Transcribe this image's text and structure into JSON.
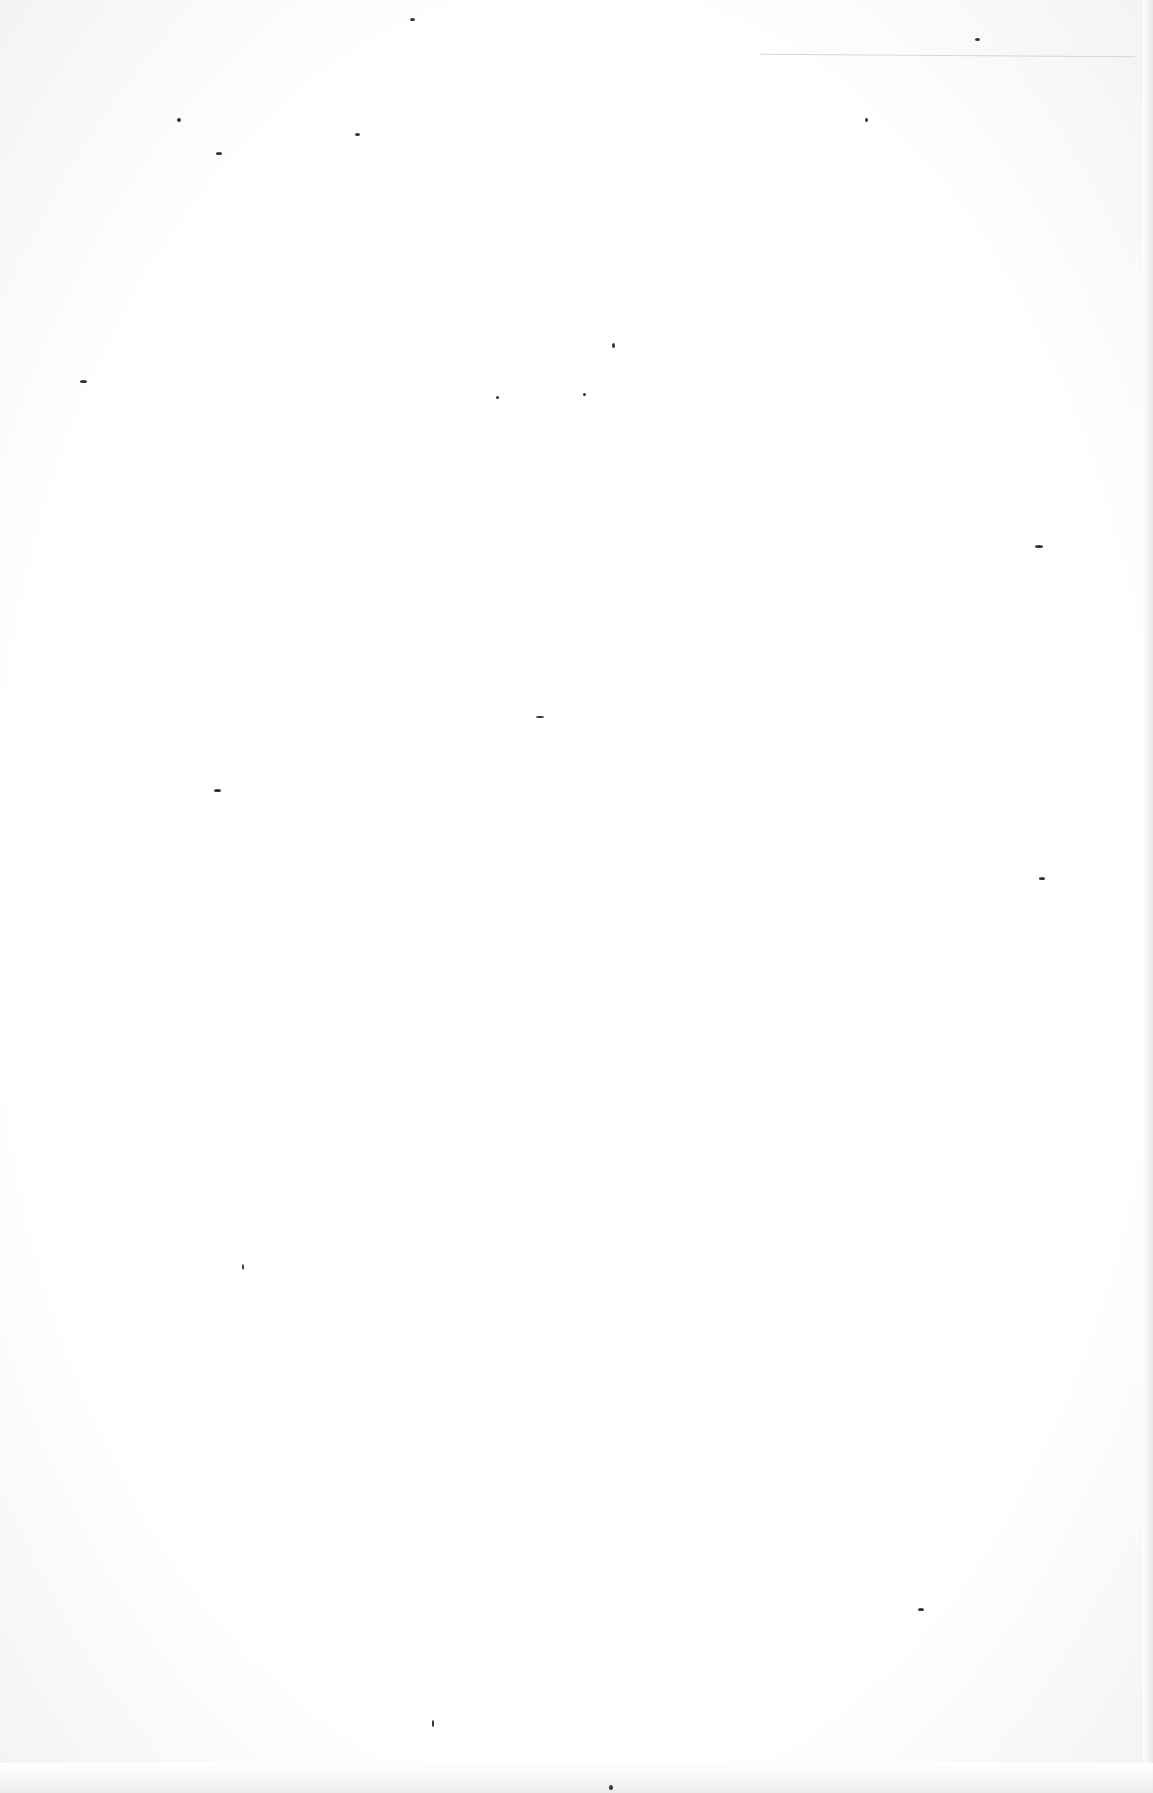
{
  "page": {
    "type": "blank scanned page",
    "text": "",
    "background_color": "#ffffff",
    "speck_color": "#333333"
  },
  "specks": [
    {
      "x": 410,
      "y": 18,
      "w": 5,
      "h": 3
    },
    {
      "x": 177,
      "y": 118,
      "w": 4,
      "h": 4
    },
    {
      "x": 216,
      "y": 152,
      "w": 6,
      "h": 3
    },
    {
      "x": 355,
      "y": 133,
      "w": 5,
      "h": 3
    },
    {
      "x": 975,
      "y": 38,
      "w": 5,
      "h": 3
    },
    {
      "x": 865,
      "y": 118,
      "w": 3,
      "h": 4
    },
    {
      "x": 612,
      "y": 343,
      "w": 3,
      "h": 5
    },
    {
      "x": 80,
      "y": 380,
      "w": 7,
      "h": 3
    },
    {
      "x": 496,
      "y": 396,
      "w": 3,
      "h": 3
    },
    {
      "x": 583,
      "y": 393,
      "w": 3,
      "h": 3
    },
    {
      "x": 1035,
      "y": 545,
      "w": 8,
      "h": 3
    },
    {
      "x": 536,
      "y": 716,
      "w": 8,
      "h": 2
    },
    {
      "x": 214,
      "y": 789,
      "w": 7,
      "h": 3
    },
    {
      "x": 1039,
      "y": 877,
      "w": 6,
      "h": 3
    },
    {
      "x": 242,
      "y": 1264,
      "w": 2,
      "h": 6
    },
    {
      "x": 918,
      "y": 1608,
      "w": 6,
      "h": 3
    },
    {
      "x": 432,
      "y": 1720,
      "w": 2,
      "h": 7
    },
    {
      "x": 609,
      "y": 1785,
      "w": 4,
      "h": 5
    }
  ]
}
